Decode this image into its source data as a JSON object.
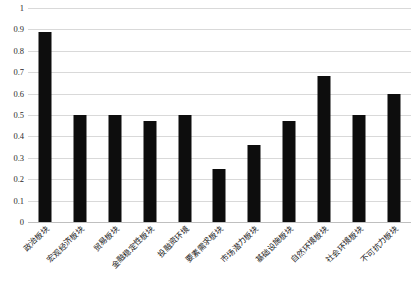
{
  "chart_data": {
    "type": "bar",
    "title": "",
    "xlabel": "",
    "ylabel": "",
    "ylim": [
      0,
      1
    ],
    "grid": true,
    "legend": "none",
    "y_ticks": [
      "1",
      "0.9",
      "0.8",
      "0.7",
      "0.6",
      "0.5",
      "0.4",
      "0.3",
      "0.2",
      "0.1",
      "0"
    ],
    "y_tick_values": [
      1,
      0.9,
      0.8,
      0.7,
      0.6,
      0.5,
      0.4,
      0.3,
      0.2,
      0.1,
      0
    ],
    "categories": [
      "政治板块",
      "宏观经济板块",
      "贸易板块",
      "金融稳定性板块",
      "投融资环境",
      "要素需求板块",
      "市场潜力板块",
      "基础设施板块",
      "自然环境板块",
      "社会环境板块",
      "不可抗力板块"
    ],
    "values": [
      0.89,
      0.5,
      0.5,
      0.47,
      0.5,
      0.25,
      0.36,
      0.47,
      0.68,
      0.5,
      0.6
    ],
    "bar_color": "#0d0d0d",
    "grid_color": "#d9d9d9"
  }
}
